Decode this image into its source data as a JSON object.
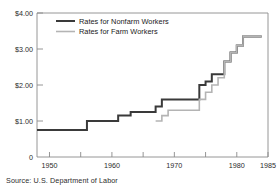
{
  "chart_data": {
    "type": "line",
    "title": "",
    "subtitle": "",
    "xlabel": "",
    "ylabel": "",
    "xlim": [
      1948,
      1985
    ],
    "ylim": [
      0,
      4.0
    ],
    "grid": false,
    "legend_position": "top-center",
    "step_style": "post",
    "y_ticks": [
      {
        "value": 0,
        "label": "0"
      },
      {
        "value": 1,
        "label": "$1.00"
      },
      {
        "value": 2,
        "label": "$2.00"
      },
      {
        "value": 3,
        "label": "$3.00"
      },
      {
        "value": 4,
        "label": "$4.00"
      }
    ],
    "x_ticks_major": [
      {
        "value": 1950,
        "label": "1950"
      },
      {
        "value": 1960,
        "label": "1960"
      },
      {
        "value": 1970,
        "label": "1970"
      },
      {
        "value": 1980,
        "label": "1980"
      },
      {
        "value": 1985,
        "label": "1985"
      }
    ],
    "x_ticks_minor": [
      1955,
      1965,
      1975
    ],
    "series": [
      {
        "name": "Rates for Nonfarm Workers",
        "color": "#3a3a3a",
        "width": 2.0,
        "x": [
          1948,
          1956,
          1961,
          1963,
          1967,
          1968,
          1974,
          1975,
          1976,
          1978,
          1979,
          1980,
          1981,
          1984
        ],
        "values": [
          0.75,
          1.0,
          1.15,
          1.25,
          1.4,
          1.6,
          2.0,
          2.1,
          2.3,
          2.65,
          2.9,
          3.1,
          3.35,
          3.35
        ]
      },
      {
        "name": "Rates for Farm Workers",
        "color": "#b4b4b4",
        "width": 1.6,
        "x": [
          1967,
          1968,
          1969,
          1974,
          1975,
          1976,
          1977,
          1978,
          1979,
          1980,
          1981,
          1984
        ],
        "values": [
          1.0,
          1.15,
          1.3,
          1.6,
          1.8,
          2.0,
          2.2,
          2.65,
          2.9,
          3.1,
          3.35,
          3.35
        ]
      }
    ],
    "legend": [
      {
        "label": "Rates for Nonfarm Workers",
        "color": "#3a3a3a",
        "width": 2.0
      },
      {
        "label": "Rates for Farm Workers",
        "color": "#b4b4b4",
        "width": 1.6
      }
    ],
    "source": "Source: U.S. Department of Labor",
    "frame_color": "#8a8a8a",
    "background": "#ffffff"
  }
}
